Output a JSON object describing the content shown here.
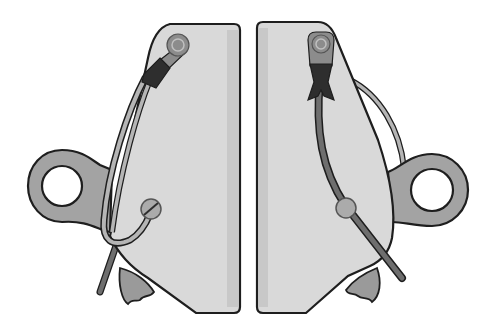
{
  "figure": {
    "colors": {
      "background": "#ffffff",
      "plate_fill": "#d9d9d9",
      "plate_shade": "#c8c8c8",
      "outline": "#1e1e1e",
      "eye_fill": "#a3a3a3",
      "cable_fill": "#6e6e6e",
      "cable_light": "#b5b5b5",
      "cam_fill": "#9a9a9a",
      "pivot_fill": "#8c8c8c",
      "ferrule_fill": "#2e2e2e",
      "pin_fill": "#ababab"
    },
    "parts": {
      "left_half": {
        "label": "left-plate",
        "components": [
          "pivot-rivet",
          "crimp-ferrule",
          "cable-loop",
          "attachment-eye",
          "slotted-pin",
          "toothed-cam"
        ]
      },
      "right_half": {
        "label": "right-plate",
        "components": [
          "pivot-rivet",
          "crimp-ferrule",
          "cable-loop",
          "attachment-eye",
          "round-pin",
          "toothed-cam",
          "lever-arm"
        ]
      }
    }
  }
}
